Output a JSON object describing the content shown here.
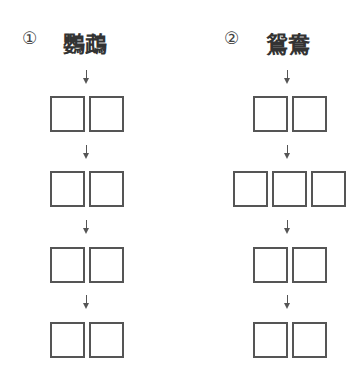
{
  "items": [
    {
      "number": "①",
      "word": "鸚鵡",
      "box_rows": [
        2,
        2,
        2,
        2
      ]
    },
    {
      "number": "②",
      "word": "鴛鴦",
      "box_rows": [
        2,
        3,
        2,
        2
      ]
    }
  ],
  "colors": {
    "line": "#555555",
    "text": "#333333"
  }
}
